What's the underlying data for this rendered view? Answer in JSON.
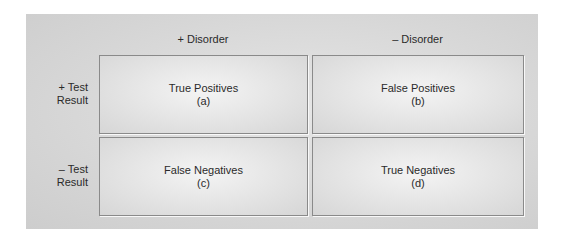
{
  "columns": [
    {
      "label": "+ Disorder"
    },
    {
      "label": "– Disorder"
    }
  ],
  "rows": [
    {
      "label_line1": "+ Test",
      "label_line2": "Result"
    },
    {
      "label_line1": "– Test",
      "label_line2": "Result"
    }
  ],
  "cells": [
    {
      "title": "True Positives",
      "code": "(a)"
    },
    {
      "title": "False Positives",
      "code": "(b)"
    },
    {
      "title": "False Negatives",
      "code": "(c)"
    },
    {
      "title": "True Negatives",
      "code": "(d)"
    }
  ]
}
